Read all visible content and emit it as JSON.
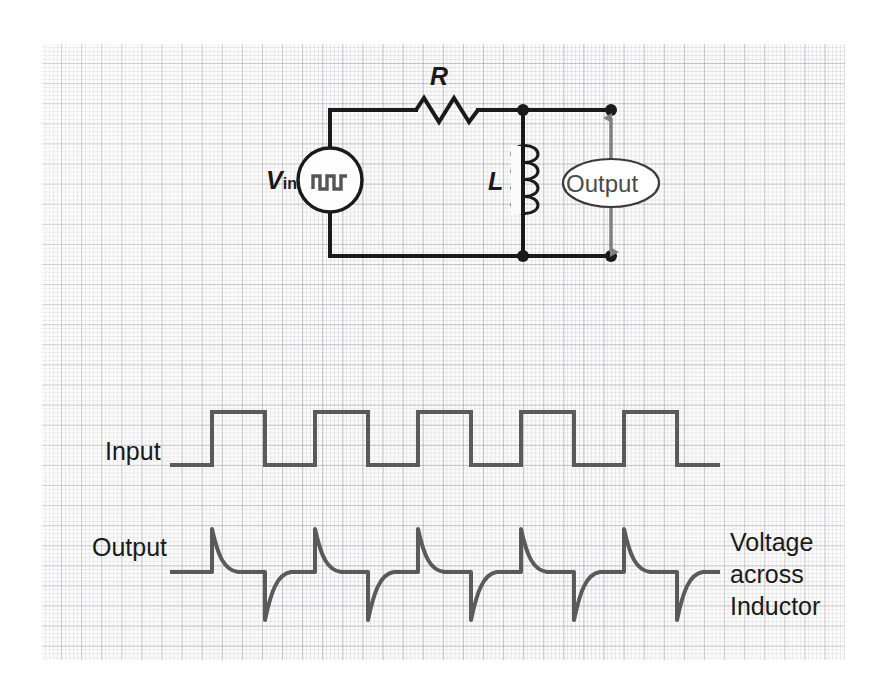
{
  "figure": {
    "background_color": "#ffffff",
    "paper_color": "#fbfbfb",
    "grid_major_color": "#a0a0a5",
    "grid_minor_color": "#b9b9be",
    "wire_color": "#1a1a1a",
    "waveform_color": "#5a5a5a",
    "arrow_color": "#808080"
  },
  "circuit": {
    "source_label_main": "V",
    "source_label_sub": "in",
    "source_symbol": "square-wave-glyph",
    "resistor_label": "R",
    "inductor_label": "L",
    "output_label": "Output"
  },
  "waveforms": {
    "input": {
      "label": "Input",
      "type": "square",
      "pulses": 5,
      "baseline_y": 465,
      "high_y": 412,
      "start_x": 170,
      "end_x": 720,
      "first_edge_x": 212,
      "period_px": 103,
      "duty_px": 53
    },
    "output": {
      "label": "Output",
      "type": "differentiated-spikes",
      "pulses": 5,
      "baseline_y": 572,
      "peak_up_y": 529,
      "peak_down_y": 620,
      "start_x": 170,
      "end_x": 720,
      "first_edge_x": 212,
      "period_px": 103,
      "duty_px": 53,
      "decay_tau_px": 13
    }
  },
  "annotations": {
    "right_line_1": "Voltage",
    "right_line_2": "across",
    "right_line_3": "Inductor"
  }
}
